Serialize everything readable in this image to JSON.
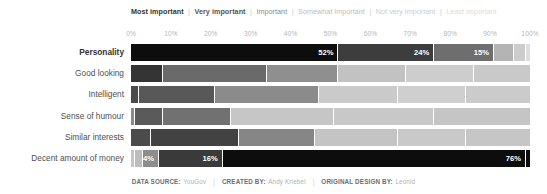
{
  "chart_data": {
    "type": "bar",
    "subtype": "100% stacked horizontal bar",
    "title": "",
    "xlabel": "",
    "ylabel": "",
    "xlim": [
      0,
      100
    ],
    "grid": false,
    "legend_position": "top",
    "orientation": "horizontal",
    "stacked": true,
    "categories": [
      "Personality",
      "Good looking",
      "Intelligent",
      "Sense of humour",
      "Similar interests",
      "Decent amount of money"
    ],
    "series": [
      {
        "name": "Most important",
        "color": "#0d0d0d",
        "values": [
          52,
          8,
          2,
          1,
          5,
          1
        ]
      },
      {
        "name": "Very important",
        "color": "#3d3d3d",
        "values": [
          24,
          26,
          19,
          7,
          22,
          2
        ]
      },
      {
        "name": "Important",
        "color": "#6e6e6e",
        "values": [
          15,
          18,
          26,
          17,
          19,
          4
        ]
      },
      {
        "name": "Somewhat important",
        "color": "#a8a8a8",
        "values": [
          5,
          17,
          20,
          26,
          21,
          16
        ]
      },
      {
        "name": "Not very important",
        "color": "#c8c8c8",
        "values": [
          3,
          17,
          17,
          25,
          17,
          76
        ]
      },
      {
        "name": "Least important",
        "color": "#dcdcdc",
        "values": [
          1,
          14,
          16,
          24,
          16,
          1
        ]
      }
    ],
    "tick_labels": [
      "0%",
      "10%",
      "20%",
      "30%",
      "40%",
      "50%",
      "60%",
      "70%",
      "80%",
      "90%",
      "100%"
    ],
    "tick_values": [
      0,
      10,
      20,
      30,
      40,
      50,
      60,
      70,
      80,
      90,
      100
    ],
    "annotations": [
      {
        "category": "Personality",
        "series": "Most important",
        "label": "52%"
      },
      {
        "category": "Personality",
        "series": "Very important",
        "label": "24%"
      },
      {
        "category": "Personality",
        "series": "Important",
        "label": "15%"
      },
      {
        "category": "Decent amount of money",
        "series": "Important",
        "label": "4%"
      },
      {
        "category": "Decent amount of money",
        "series": "Somewhat important",
        "label": "16%"
      },
      {
        "category": "Decent amount of money",
        "series": "Not very important",
        "label": "76%"
      }
    ]
  },
  "legend": {
    "separator": "|",
    "items": [
      {
        "label": "Most important",
        "color": "#333333",
        "weight": "bold"
      },
      {
        "label": "Very important",
        "color": "#555555",
        "weight": "bold"
      },
      {
        "label": "Important",
        "color": "#8a8a8a",
        "weight": "normal"
      },
      {
        "label": "Somewhat important",
        "color": "#bcbcbc",
        "weight": "normal"
      },
      {
        "label": "Not very important",
        "color": "#cdcdcd",
        "weight": "normal"
      },
      {
        "label": "Least important",
        "color": "#dddddd",
        "weight": "normal"
      }
    ]
  },
  "rows": [
    {
      "label": "Personality",
      "emphasis": true,
      "segments": [
        {
          "series": "Most important",
          "value": 52,
          "color": "#0d0d0d",
          "label": "52%"
        },
        {
          "series": "Very important",
          "value": 24,
          "color": "#3d3d3d",
          "label": "24%"
        },
        {
          "series": "Important",
          "value": 15,
          "color": "#6e6e6e",
          "label": "15%"
        },
        {
          "series": "Somewhat important",
          "value": 5,
          "color": "#b4b4b4",
          "label": ""
        },
        {
          "series": "Not very important",
          "value": 3,
          "color": "#cccccc",
          "label": ""
        },
        {
          "series": "Least important",
          "value": 1,
          "color": "#dedede",
          "label": ""
        }
      ]
    },
    {
      "label": "Good looking",
      "emphasis": false,
      "segments": [
        {
          "series": "Most important",
          "value": 8,
          "color": "#343434",
          "label": ""
        },
        {
          "series": "Very important",
          "value": 26,
          "color": "#6a6a6a",
          "label": ""
        },
        {
          "series": "Important",
          "value": 18,
          "color": "#8f8f8f",
          "label": ""
        },
        {
          "series": "Somewhat important",
          "value": 17,
          "color": "#c2c2c2",
          "label": ""
        },
        {
          "series": "Not very important",
          "value": 17,
          "color": "#cdcdcd",
          "label": ""
        },
        {
          "series": "Least important",
          "value": 14,
          "color": "#c9c9c9",
          "label": ""
        }
      ]
    },
    {
      "label": "Intelligent",
      "emphasis": false,
      "segments": [
        {
          "series": "Most important",
          "value": 2,
          "color": "#4a4a4a",
          "label": ""
        },
        {
          "series": "Very important",
          "value": 19,
          "color": "#585858",
          "label": ""
        },
        {
          "series": "Important",
          "value": 26,
          "color": "#8b8b8b",
          "label": ""
        },
        {
          "series": "Somewhat important",
          "value": 20,
          "color": "#cacaca",
          "label": ""
        },
        {
          "series": "Not very important",
          "value": 17,
          "color": "#cfcfcf",
          "label": ""
        },
        {
          "series": "Least important",
          "value": 16,
          "color": "#cbcbcb",
          "label": ""
        }
      ]
    },
    {
      "label": "Sense of humour",
      "emphasis": false,
      "segments": [
        {
          "series": "Most important",
          "value": 1,
          "color": "#8a8a8a",
          "label": ""
        },
        {
          "series": "Very important",
          "value": 7,
          "color": "#5a5a5a",
          "label": ""
        },
        {
          "series": "Important",
          "value": 17,
          "color": "#717171",
          "label": ""
        },
        {
          "series": "Somewhat important",
          "value": 26,
          "color": "#c6c6c6",
          "label": ""
        },
        {
          "series": "Not very important",
          "value": 25,
          "color": "#c8c8c8",
          "label": ""
        },
        {
          "series": "Least important",
          "value": 24,
          "color": "#c5c5c5",
          "label": ""
        }
      ]
    },
    {
      "label": "Similar interests",
      "emphasis": false,
      "segments": [
        {
          "series": "Most important",
          "value": 5,
          "color": "#4b4b4b",
          "label": ""
        },
        {
          "series": "Very important",
          "value": 22,
          "color": "#424242",
          "label": ""
        },
        {
          "series": "Important",
          "value": 19,
          "color": "#868686",
          "label": ""
        },
        {
          "series": "Somewhat important",
          "value": 21,
          "color": "#c4c4c4",
          "label": ""
        },
        {
          "series": "Not very important",
          "value": 17,
          "color": "#c9c9c9",
          "label": ""
        },
        {
          "series": "Least important",
          "value": 16,
          "color": "#c6c6c6",
          "label": ""
        }
      ]
    },
    {
      "label": "Decent amount of money",
      "emphasis": false,
      "segments": [
        {
          "series": "Most important",
          "value": 1,
          "color": "#c6c6c6",
          "label": ""
        },
        {
          "series": "Very important",
          "value": 2,
          "color": "#bdbdbd",
          "label": ""
        },
        {
          "series": "Important",
          "value": 4,
          "color": "#8d8d8d",
          "label": "4%"
        },
        {
          "series": "Somewhat important",
          "value": 16,
          "color": "#3a3a3a",
          "label": "16%"
        },
        {
          "series": "Not very important",
          "value": 76,
          "color": "#0d0d0d",
          "label": "76%"
        },
        {
          "series": "Least important",
          "value": 1,
          "color": "#0d0d0d",
          "label": ""
        }
      ]
    }
  ],
  "footer": {
    "items": [
      {
        "key": "DATA SOURCE:",
        "value": "YouGov"
      },
      {
        "key": "CREATED BY:",
        "value": "Andy Kriebel"
      },
      {
        "key": "ORIGINAL DESIGN BY:",
        "value": "Leonid"
      }
    ],
    "separator": "|"
  }
}
